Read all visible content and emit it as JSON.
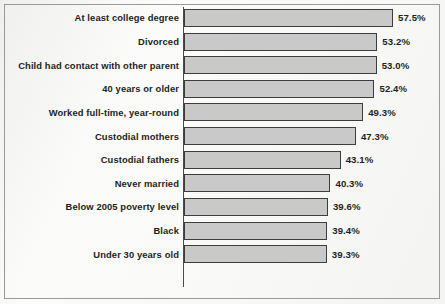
{
  "figure": {
    "background_color": "#fbfbfa",
    "frame_color": "#9a9a9a",
    "bar_fill_color": "#c9c9c9",
    "bar_border_color": "#3d3d3d",
    "axis_color": "#4a4a4a",
    "text_color": "#231f20"
  },
  "chart_data": {
    "type": "bar",
    "orientation": "horizontal",
    "title": "",
    "subtitle": "",
    "xlabel": "",
    "ylabel": "",
    "grid": false,
    "legend": null,
    "xlim": [
      0,
      57.5
    ],
    "value_suffix": "%",
    "categories": [
      "At least college degree",
      "Divorced",
      "Child had contact with other parent",
      "40 years or older",
      "Worked full-time, year-round",
      "Custodial mothers",
      "Custodial fathers",
      "Never married",
      "Below 2005 poverty level",
      "Black",
      "Under 30 years old"
    ],
    "values": [
      57.5,
      53.2,
      53.0,
      52.4,
      49.3,
      47.3,
      43.1,
      40.3,
      39.6,
      39.4,
      39.3
    ],
    "value_labels": [
      "57.5%",
      "53.2%",
      "53.0%",
      "52.4%",
      "49.3%",
      "47.3%",
      "43.1%",
      "40.3%",
      "39.6%",
      "39.4%",
      "39.3%"
    ]
  }
}
